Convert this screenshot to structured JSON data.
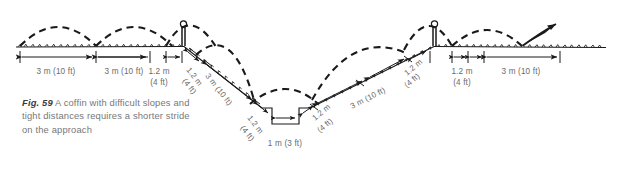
{
  "figure": {
    "number_label": "Fig. 59",
    "caption_text": "A coffin with difficult slopes and tight distances requires a shorter stride on the approach",
    "caption_full": "Fig. 59 A coffin with difficult slopes and tight distances requires a shorter stride on the approach"
  },
  "dimensions": {
    "approach_stride_1": "3 m (10 ft)",
    "approach_stride_2": "3 m (10 ft)",
    "takeoff_to_fence_a": "1.2 m\n(4 ft)",
    "takeoff_to_fence_a_line1": "1.2 m",
    "takeoff_to_fence_a_line2": "(4 ft)",
    "landing_after_fence_a_line1": "1.2 m",
    "landing_after_fence_a_line2": "(4 ft)",
    "downslope_stride_line1": "3 m (10 ft)",
    "ditch_takeoff_line1": "1.2 m",
    "ditch_takeoff_line2": "(4 ft)",
    "ditch_width_line1": "1 m (3 ft)",
    "ditch_landing_line1": "1.2 m",
    "ditch_landing_line2": "(4 ft)",
    "upslope_stride_line1": "3 m (10 ft)",
    "approach_fence_b_line1": "1.2 m",
    "approach_fence_b_line2": "(4 ft)",
    "landing_fence_b_line1": "1.2 m",
    "landing_fence_b_line2": "(4 ft)",
    "departure_stride": "3 m (10 ft)"
  },
  "elements": {
    "fence_a_name": "upright-post-fence-left",
    "fence_b_name": "upright-post-fence-right",
    "ditch_name": "coffin-ditch",
    "ground_name": "ground-line",
    "departure_arrow_name": "departure-arrow"
  },
  "colors": {
    "ink": "#1a1a1a",
    "label_gray": "#6b6b6b",
    "caption_gray": "#77777a",
    "caption_bold": "#3b3b3d",
    "background": "#ffffff"
  }
}
